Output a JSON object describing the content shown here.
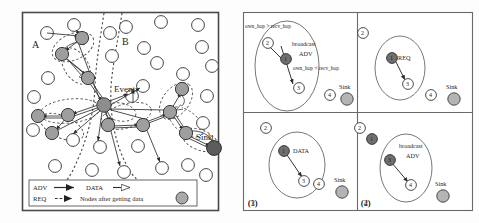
{
  "figure": {
    "title": "",
    "panels": [
      "left-network-diagram",
      "right-four-step-sequence"
    ]
  },
  "left_panel": {
    "region_labels": [
      {
        "name": "A",
        "text": "A",
        "x": 32,
        "y": 45
      },
      {
        "name": "B",
        "text": "B",
        "x": 121,
        "y": 42
      }
    ],
    "event_label": {
      "text": "Event",
      "x": 117,
      "y": 92
    },
    "sink_label": {
      "text": "Sink",
      "x": 205,
      "y": 139
    },
    "legend": {
      "rows": [
        {
          "key": "ADV",
          "key_text": "ADV",
          "arrow": "solid-filled-arrow",
          "value_text": "DATA",
          "value_arrow": "hollow-arrow"
        },
        {
          "key": "REQ",
          "key_text": "REQ",
          "arrow": "dashed-filled-arrow",
          "value_text": "Nodes after getting data",
          "value_arrow": "gray-circle"
        }
      ]
    },
    "plain_nodes": [
      {
        "x": 74,
        "y": 25
      },
      {
        "x": 47,
        "y": 33
      },
      {
        "x": 126,
        "y": 27
      },
      {
        "x": 161,
        "y": 22
      },
      {
        "x": 198,
        "y": 25
      },
      {
        "x": 202,
        "y": 47
      },
      {
        "x": 144,
        "y": 48
      },
      {
        "x": 112,
        "y": 56
      },
      {
        "x": 157,
        "y": 63
      },
      {
        "x": 183,
        "y": 74
      },
      {
        "x": 48,
        "y": 78
      },
      {
        "x": 34,
        "y": 97
      },
      {
        "x": 212,
        "y": 66
      },
      {
        "x": 207,
        "y": 96
      },
      {
        "x": 143,
        "y": 86
      },
      {
        "x": 100,
        "y": 124
      },
      {
        "x": 73,
        "y": 137
      },
      {
        "x": 138,
        "y": 128
      },
      {
        "x": 188,
        "y": 123
      },
      {
        "x": 55,
        "y": 160
      },
      {
        "x": 92,
        "y": 157
      },
      {
        "x": 124,
        "y": 166
      },
      {
        "x": 162,
        "y": 160
      },
      {
        "x": 197,
        "y": 152
      },
      {
        "x": 206,
        "y": 175
      },
      {
        "x": 33,
        "y": 130
      }
    ],
    "data_nodes": [
      {
        "x": 82,
        "y": 38,
        "name": "node-upper-right"
      },
      {
        "x": 62,
        "y": 54,
        "name": "node-upper-left"
      },
      {
        "x": 88,
        "y": 78,
        "name": "node-mid-upper"
      },
      {
        "x": 104,
        "y": 105,
        "name": "node-event-hub"
      },
      {
        "x": 38,
        "y": 116,
        "name": "node-far-left"
      },
      {
        "x": 68,
        "y": 115,
        "name": "node-left-mid"
      },
      {
        "x": 52,
        "y": 133,
        "name": "node-left-lower"
      },
      {
        "x": 108,
        "y": 125,
        "name": "node-lower-center"
      },
      {
        "x": 143,
        "y": 125,
        "name": "node-right-lower"
      },
      {
        "x": 170,
        "y": 112,
        "name": "node-right-mid"
      },
      {
        "x": 182,
        "y": 89,
        "name": "node-right-upper"
      },
      {
        "x": 186,
        "y": 133,
        "name": "node-near-sink"
      }
    ],
    "sink_node": {
      "x": 214,
      "y": 148,
      "name": "sink"
    }
  },
  "right_panel": {
    "steps": [
      {
        "id": "(1)",
        "annotations": [
          {
            "text": "own_hop > recv_hop",
            "name": "own-hop-greater-label"
          },
          {
            "text": "broadcast",
            "name": "broadcast-label"
          },
          {
            "text": "ADV",
            "name": "adv-label"
          },
          {
            "text": "own_hop < recv_hop",
            "name": "own-hop-less-label"
          }
        ],
        "nodes": [
          {
            "label": "2",
            "state": "plain",
            "name": "node-2"
          },
          {
            "label": "1",
            "state": "dark",
            "name": "node-1"
          },
          {
            "label": "3",
            "state": "plain",
            "name": "node-3"
          },
          {
            "label": "4",
            "state": "plain",
            "name": "node-4"
          }
        ],
        "sink_label": "Sink"
      },
      {
        "id": "(2)",
        "annotations": [
          {
            "text": "REQ",
            "name": "req-label"
          }
        ],
        "nodes": [
          {
            "label": "2",
            "state": "plain",
            "name": "node-2"
          },
          {
            "label": "1",
            "state": "dark",
            "name": "node-1"
          },
          {
            "label": "3",
            "state": "plain",
            "name": "node-3"
          },
          {
            "label": "4",
            "state": "plain",
            "name": "node-4"
          }
        ],
        "sink_label": "Sink"
      },
      {
        "id": "(3)",
        "annotations": [
          {
            "text": "DATA",
            "name": "data-label"
          }
        ],
        "nodes": [
          {
            "label": "2",
            "state": "plain",
            "name": "node-2"
          },
          {
            "label": "1",
            "state": "dark",
            "name": "node-1"
          },
          {
            "label": "3",
            "state": "plain",
            "name": "node-3"
          },
          {
            "label": "4",
            "state": "plain",
            "name": "node-4"
          }
        ],
        "sink_label": "Sink"
      },
      {
        "id": "(4)",
        "annotations": [
          {
            "text": "broadcast",
            "name": "broadcast-label"
          },
          {
            "text": "ADV",
            "name": "adv-label"
          }
        ],
        "nodes": [
          {
            "label": "2",
            "state": "plain",
            "name": "node-2"
          },
          {
            "label": "1",
            "state": "dark",
            "name": "node-1"
          },
          {
            "label": "3",
            "state": "dark",
            "name": "node-3"
          },
          {
            "label": "4",
            "state": "plain",
            "name": "node-4"
          }
        ],
        "sink_label": "Sink"
      }
    ]
  },
  "colors": {
    "node_fill": "#9e9e9e",
    "node_dark_fill": "#555555",
    "node_stroke": "#3a3a3a",
    "plain_fill": "#ffffff",
    "line": "#333333",
    "border": "#4a4a4a",
    "background": "#ffffff"
  }
}
